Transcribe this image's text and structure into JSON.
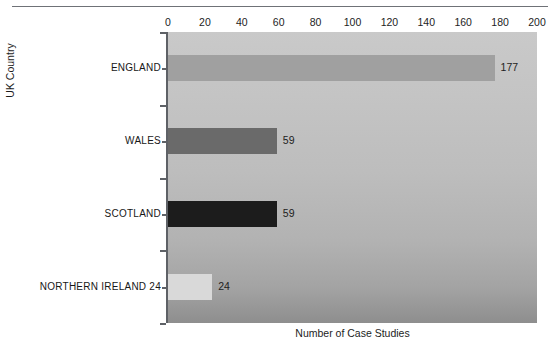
{
  "figure": {
    "clipped_caption": "",
    "top_rule": "horizontal-rule"
  },
  "chart_data": {
    "type": "bar",
    "orientation": "horizontal",
    "title": "",
    "xlabel": "Number of Case Studies",
    "ylabel": "UK Country",
    "categories": [
      "ENGLAND",
      "WALES",
      "SCOTLAND",
      "NORTHERN IRELAND 24"
    ],
    "values": [
      177,
      59,
      59,
      24
    ],
    "value_labels": [
      "177",
      "59",
      "59",
      "24"
    ],
    "xlim": [
      0,
      200
    ],
    "xticks": [
      0,
      20,
      40,
      60,
      80,
      100,
      120,
      140,
      160,
      180,
      200
    ],
    "xtick_labels": [
      "0",
      "20",
      "40",
      "60",
      "80",
      "100",
      "120",
      "140",
      "160",
      "180",
      "200"
    ],
    "xaxis_position": "top",
    "grid": false,
    "legend": "none",
    "bar_colors": [
      "#a0a0a0",
      "#6a6a6a",
      "#1c1c1c",
      "#d9d9d9"
    ],
    "plot_background": "gray-vertical-gradient"
  }
}
